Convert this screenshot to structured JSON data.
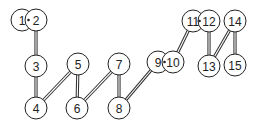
{
  "diagram": {
    "type": "node-link graph (numbered path)",
    "nodes": [
      {
        "id": "1",
        "label": "1",
        "x": 22,
        "y": 20
      },
      {
        "id": "2",
        "label": "2",
        "x": 36,
        "y": 20
      },
      {
        "id": "3",
        "label": "3",
        "x": 36,
        "y": 66
      },
      {
        "id": "4",
        "label": "4",
        "x": 36,
        "y": 108
      },
      {
        "id": "5",
        "label": "5",
        "x": 78,
        "y": 64
      },
      {
        "id": "6",
        "label": "6",
        "x": 77,
        "y": 108
      },
      {
        "id": "7",
        "label": "7",
        "x": 119,
        "y": 64
      },
      {
        "id": "8",
        "label": "8",
        "x": 119,
        "y": 108
      },
      {
        "id": "9",
        "label": "9",
        "x": 158,
        "y": 62
      },
      {
        "id": "10",
        "label": "10",
        "x": 173,
        "y": 62
      },
      {
        "id": "11",
        "label": "11",
        "x": 193,
        "y": 21
      },
      {
        "id": "12",
        "label": "12",
        "x": 209,
        "y": 21
      },
      {
        "id": "13",
        "label": "13",
        "x": 209,
        "y": 66
      },
      {
        "id": "14",
        "label": "14",
        "x": 235,
        "y": 21
      },
      {
        "id": "15",
        "label": "15",
        "x": 235,
        "y": 65
      }
    ],
    "edges": [
      {
        "from": "1",
        "to": "2",
        "style": "dot"
      },
      {
        "from": "2",
        "to": "3",
        "style": "double"
      },
      {
        "from": "3",
        "to": "4",
        "style": "double"
      },
      {
        "from": "4",
        "to": "5",
        "style": "double"
      },
      {
        "from": "5",
        "to": "6",
        "style": "double"
      },
      {
        "from": "6",
        "to": "7",
        "style": "double"
      },
      {
        "from": "7",
        "to": "8",
        "style": "double"
      },
      {
        "from": "8",
        "to": "9",
        "style": "double"
      },
      {
        "from": "9",
        "to": "10",
        "style": "dot"
      },
      {
        "from": "10",
        "to": "11",
        "style": "double"
      },
      {
        "from": "11",
        "to": "12",
        "style": "dot"
      },
      {
        "from": "12",
        "to": "13",
        "style": "double"
      },
      {
        "from": "13",
        "to": "14",
        "style": "double"
      },
      {
        "from": "14",
        "to": "15",
        "style": "double"
      }
    ],
    "node_radius": 11,
    "colors": {
      "stroke": "#222222",
      "fill": "#ffffff",
      "text": "#222222"
    }
  }
}
